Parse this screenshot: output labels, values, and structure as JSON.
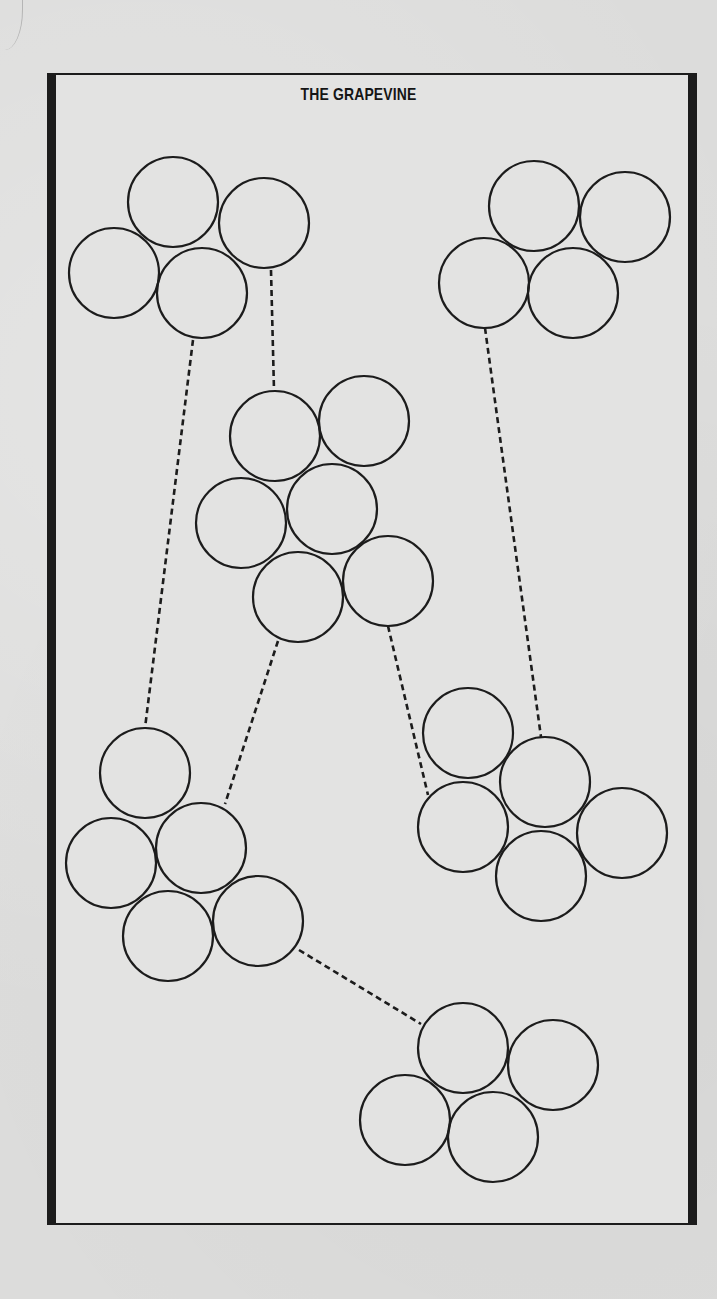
{
  "figure": {
    "title": "THE GRAPEVINE",
    "stroke_color": "#1c1c1c",
    "paper_color": "#e3e3e2",
    "circle_radius": 45,
    "clusters": [
      {
        "id": "top-left",
        "circles": [
          [
            173,
            202
          ],
          [
            264,
            223
          ],
          [
            114,
            273
          ],
          [
            202,
            293
          ]
        ]
      },
      {
        "id": "top-right",
        "circles": [
          [
            534,
            206
          ],
          [
            625,
            217
          ],
          [
            484,
            283
          ],
          [
            573,
            293
          ]
        ]
      },
      {
        "id": "middle",
        "circles": [
          [
            275,
            436
          ],
          [
            364,
            421
          ],
          [
            241,
            523
          ],
          [
            332,
            509
          ],
          [
            298,
            597
          ],
          [
            388,
            581
          ]
        ]
      },
      {
        "id": "bottom-left",
        "circles": [
          [
            145,
            773
          ],
          [
            111,
            863
          ],
          [
            201,
            848
          ],
          [
            168,
            936
          ],
          [
            258,
            921
          ]
        ]
      },
      {
        "id": "bottom-right",
        "circles": [
          [
            468,
            733
          ],
          [
            545,
            782
          ],
          [
            463,
            827
          ],
          [
            622,
            833
          ],
          [
            541,
            876
          ]
        ]
      },
      {
        "id": "bottom",
        "circles": [
          [
            463,
            1048
          ],
          [
            553,
            1065
          ],
          [
            405,
            1120
          ],
          [
            493,
            1137
          ]
        ]
      }
    ],
    "connections": [
      {
        "from": "top-left",
        "to": "middle",
        "points": [
          [
            271,
            270
          ],
          [
            274,
            390
          ]
        ]
      },
      {
        "from": "top-left",
        "to": "bottom-left",
        "points": [
          [
            193,
            340
          ],
          [
            145,
            728
          ]
        ]
      },
      {
        "from": "top-right",
        "to": "bottom-right",
        "points": [
          [
            485,
            328
          ],
          [
            541,
            737
          ]
        ]
      },
      {
        "from": "middle",
        "to": "bottom-left",
        "points": [
          [
            278,
            641
          ],
          [
            225,
            804
          ]
        ]
      },
      {
        "from": "middle",
        "to": "bottom-right",
        "points": [
          [
            388,
            626
          ],
          [
            428,
            795
          ]
        ]
      },
      {
        "from": "bottom-left",
        "to": "bottom",
        "points": [
          [
            299,
            950
          ],
          [
            421,
            1024
          ]
        ]
      }
    ]
  }
}
